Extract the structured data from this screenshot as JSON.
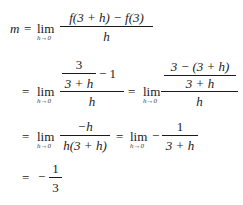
{
  "equation": {
    "row1": {
      "lhs": "m",
      "eq": "=",
      "lim": "lim",
      "lim_sub": "h→0",
      "numerator": "f(3 + h) − f(3)",
      "denominator": "h"
    },
    "row2": {
      "eq1": "=",
      "lim1": "lim",
      "lim1_sub": "h→0",
      "inner_num": "3",
      "inner_den": "3 + h",
      "minus_one": "− 1",
      "den1": "h",
      "eq2": "=",
      "lim2": "lim",
      "lim2_sub": "h→0",
      "inner_num2": "3 − (3 + h)",
      "inner_den2": "3 + h",
      "den2": "h"
    },
    "row3": {
      "eq1": "=",
      "lim1": "lim",
      "lim1_sub": "h→0",
      "num1": "−h",
      "den1": "h(3 + h)",
      "eq2": "=",
      "lim2": "lim",
      "lim2_sub": "h→0",
      "neg": "−",
      "num2": "1",
      "den2": "3 + h"
    },
    "row4": {
      "eq": "=",
      "neg": "−",
      "num": "1",
      "den": "3"
    }
  }
}
